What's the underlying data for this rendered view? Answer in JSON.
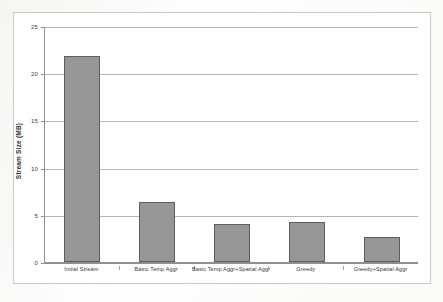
{
  "chart_data": {
    "type": "bar",
    "title": "",
    "xlabel": "",
    "ylabel": "Stream Size (MB)",
    "categories": [
      "Initial Stream",
      "Basic Temp Aggr",
      "Basic Temp Aggr+Spatial Aggr",
      "Greedy",
      "Greedy+Spatial Aggr"
    ],
    "values": [
      21.8,
      6.4,
      4.0,
      4.2,
      2.6
    ],
    "ylim": [
      0,
      25
    ],
    "yticks": [
      0,
      5,
      10,
      15,
      20,
      25
    ],
    "ytick_labels": [
      "0",
      "5",
      "10",
      "15",
      "20",
      "25"
    ],
    "grid": true,
    "legend": "none",
    "bar_color": "#969696",
    "bar_border_color": "#5d5d5d",
    "gridline_color": "#b5b5b5",
    "axis_color": "#8f8f8f",
    "plot_background": "#ffffff",
    "frame_color": "#c9c9c9"
  }
}
